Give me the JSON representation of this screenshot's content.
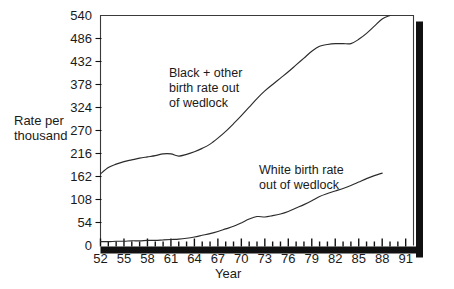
{
  "chart_data": {
    "type": "line",
    "title": "",
    "subtitle": "",
    "xlabel": "Year",
    "ylabel": "Rate per thousand",
    "ylabel_lines": [
      "Rate per",
      "thousand"
    ],
    "xlim": [
      52,
      92
    ],
    "ylim": [
      0,
      540
    ],
    "grid": false,
    "legend_position": "inline-annotations",
    "y_ticks": [
      0,
      54,
      108,
      162,
      216,
      270,
      324,
      378,
      432,
      486,
      540
    ],
    "y_tick_labels": [
      "0",
      "54",
      "108",
      "162",
      "216",
      "270",
      "324",
      "378",
      "432",
      "486",
      "540"
    ],
    "x_ticks": [
      52,
      55,
      58,
      61,
      64,
      67,
      70,
      73,
      76,
      79,
      82,
      85,
      88,
      91
    ],
    "x_tick_labels": [
      "52",
      "55",
      "58",
      "61",
      "64",
      "67",
      "70",
      "73",
      "76",
      "79",
      "82",
      "85",
      "88",
      "91"
    ],
    "x_minor_tick_step": 1,
    "annotations": [
      {
        "id": "black-other-annotation",
        "lines": [
          "Black + other",
          "birth rate out",
          "of wedlock"
        ],
        "text": "Black + other birth rate out of wedlock",
        "x": 169,
        "y": 66
      },
      {
        "id": "white-annotation",
        "lines": [
          "White birth rate",
          "out of wedlock"
        ],
        "text": "White birth rate out of wedlock",
        "x": 259,
        "y": 163
      }
    ],
    "series": [
      {
        "name": "Black + other birth rate out of wedlock",
        "color": "#2b2b2b",
        "x": [
          52,
          53,
          54,
          55,
          56,
          57,
          58,
          59,
          60,
          61,
          62,
          63,
          64,
          65,
          66,
          67,
          68,
          69,
          70,
          71,
          72,
          73,
          74,
          75,
          76,
          77,
          78,
          79,
          80,
          81,
          82,
          83,
          84,
          85,
          86,
          87,
          88,
          89
        ],
        "values": [
          168,
          183,
          191,
          197,
          201,
          205,
          208,
          211,
          215,
          215,
          210,
          214,
          220,
          228,
          238,
          252,
          268,
          286,
          305,
          325,
          345,
          363,
          378,
          393,
          408,
          424,
          440,
          456,
          468,
          472,
          474,
          474,
          474,
          484,
          498,
          515,
          532,
          540
        ]
      },
      {
        "name": "White birth rate out of wedlock",
        "color": "#2b2b2b",
        "x": [
          52,
          53,
          54,
          55,
          56,
          57,
          58,
          59,
          60,
          61,
          62,
          63,
          64,
          65,
          66,
          67,
          68,
          69,
          70,
          71,
          72,
          73,
          74,
          75,
          76,
          77,
          78,
          79,
          80,
          81,
          82,
          83,
          84,
          85,
          86,
          87,
          88
        ],
        "values": [
          9,
          9,
          10,
          10,
          11,
          11,
          12,
          12,
          13,
          14,
          15,
          17,
          20,
          24,
          28,
          33,
          39,
          45,
          53,
          62,
          68,
          67,
          70,
          74,
          80,
          88,
          96,
          105,
          115,
          122,
          128,
          134,
          141,
          149,
          157,
          164,
          170
        ]
      }
    ]
  },
  "frame": {
    "shadow_color": "#111111",
    "border_color": "#3a3a3a",
    "axis_color": "#111111",
    "plot_bg": "#ffffff"
  }
}
